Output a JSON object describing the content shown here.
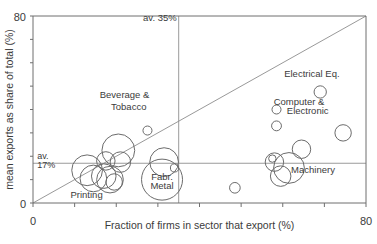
{
  "chart_data": {
    "type": "scatter",
    "title": "",
    "xlabel": "Fraction of firms in sector that export (%)",
    "ylabel": "mean exports as share of total (%)",
    "xlim": [
      0,
      80
    ],
    "ylim": [
      0,
      80
    ],
    "xticks": [
      0,
      10,
      20,
      30,
      40,
      50,
      60,
      70,
      80
    ],
    "yticks": [
      0,
      10,
      20,
      30,
      40,
      50,
      60,
      70,
      80
    ],
    "xtick_labels_shown": [
      "0",
      "80"
    ],
    "ytick_labels_shown": [
      "0",
      "80"
    ],
    "grid": false,
    "legend": "none",
    "marker_style": "open-circle-bubble",
    "reference_lines": [
      {
        "name": "average-x",
        "orientation": "vertical",
        "value": 35,
        "label": "av. 35%"
      },
      {
        "name": "average-y",
        "orientation": "horizontal",
        "value": 17,
        "label": "av. 17%"
      },
      {
        "name": "diagonal-45",
        "orientation": "diagonal",
        "from": [
          0,
          0
        ],
        "to": [
          80,
          80
        ],
        "label": ""
      }
    ],
    "annotations": [
      {
        "text": "av. 35%",
        "x": 35,
        "y": 78
      },
      {
        "text": "av.",
        "x": 1,
        "y": 19
      },
      {
        "text": "17%",
        "x": 1,
        "y": 15
      },
      {
        "text": "Beverage &",
        "x": 22,
        "y": 45
      },
      {
        "text": "Tobacco",
        "x": 23,
        "y": 40
      },
      {
        "text": "Fabr.",
        "x": 31,
        "y": 10
      },
      {
        "text": "Metal",
        "x": 31,
        "y": 6
      },
      {
        "text": "Printing",
        "x": 9,
        "y": 2
      },
      {
        "text": "Machinery",
        "x": 62,
        "y": 13
      },
      {
        "text": "Electrical Eq.",
        "x": 67,
        "y": 54
      },
      {
        "text": "Computer &",
        "x": 70,
        "y": 42
      },
      {
        "text": "Electronic",
        "x": 71,
        "y": 38
      }
    ],
    "points": [
      {
        "label": "Printing",
        "x": 13.0,
        "y": 14.0,
        "size": 7.5
      },
      {
        "label": "",
        "x": 14.5,
        "y": 10.5,
        "size": 6.5
      },
      {
        "label": "",
        "x": 17.0,
        "y": 11.5,
        "size": 6.0
      },
      {
        "label": "",
        "x": 18.5,
        "y": 10.0,
        "size": 6.5
      },
      {
        "label": "",
        "x": 17.5,
        "y": 18.0,
        "size": 4.5
      },
      {
        "label": "",
        "x": 20.5,
        "y": 22.5,
        "size": 8.0
      },
      {
        "label": "",
        "x": 21.0,
        "y": 17.5,
        "size": 5.0
      },
      {
        "label": "",
        "x": 19.5,
        "y": 9.0,
        "size": 4.0
      },
      {
        "label": "Beverage & Tobacco",
        "x": 27.5,
        "y": 31.0,
        "size": 2.2
      },
      {
        "label": "Fabr. Metal",
        "x": 31.0,
        "y": 10.0,
        "size": 10.0
      },
      {
        "label": "",
        "x": 31.5,
        "y": 17.5,
        "size": 7.0
      },
      {
        "label": "",
        "x": 34.0,
        "y": 15.0,
        "size": 2.0
      },
      {
        "label": "",
        "x": 48.5,
        "y": 6.5,
        "size": 2.6
      },
      {
        "label": "",
        "x": 58.0,
        "y": 17.5,
        "size": 4.5
      },
      {
        "label": "",
        "x": 57.5,
        "y": 19.0,
        "size": 1.8
      },
      {
        "label": "Machinery",
        "x": 61.5,
        "y": 15.0,
        "size": 7.5
      },
      {
        "label": "",
        "x": 59.5,
        "y": 11.5,
        "size": 5.0
      },
      {
        "label": "",
        "x": 64.5,
        "y": 23.0,
        "size": 4.5
      },
      {
        "label": "",
        "x": 58.5,
        "y": 40.0,
        "size": 2.2
      },
      {
        "label": "",
        "x": 58.5,
        "y": 33.0,
        "size": 2.4
      },
      {
        "label": "Electrical Eq.",
        "x": 69.0,
        "y": 47.5,
        "size": 3.0
      },
      {
        "label": "Computer & Electronic",
        "x": 74.5,
        "y": 30.0,
        "size": 4.0
      }
    ]
  },
  "caption": {
    "text": ""
  }
}
